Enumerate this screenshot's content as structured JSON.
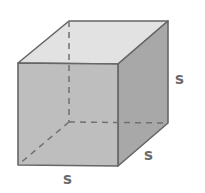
{
  "diagram": {
    "shape": "cube",
    "labels": {
      "height": "s",
      "depth": "s",
      "width": "s"
    },
    "colors": {
      "front_face": "#bebebe",
      "top_face": "#e2e2e2",
      "right_face": "#a8a8a8",
      "edge": "#666666",
      "hidden_edge": "#707070",
      "label": "#6a6a6a"
    }
  }
}
